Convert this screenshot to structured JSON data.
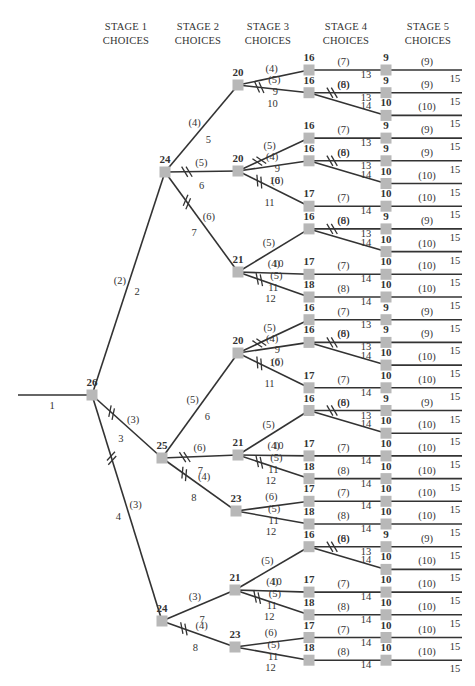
{
  "headers": [
    {
      "line1": "STAGE 1",
      "line2": "CHOICES",
      "x": 126
    },
    {
      "line1": "STAGE 2",
      "line2": "CHOICES",
      "x": 198
    },
    {
      "line1": "STAGE 3",
      "line2": "CHOICES",
      "x": 268
    },
    {
      "line1": "STAGE 4",
      "line2": "CHOICES",
      "x": 346
    },
    {
      "line1": "STAGE 5",
      "line2": "CHOICES",
      "x": 428
    }
  ],
  "colors": {
    "line": "#333333",
    "node": "#b8b8b8",
    "text": "#333333"
  },
  "root": {
    "value": "26",
    "x": 92,
    "y": 395,
    "incoming_label": "1",
    "incoming_start_x": 18
  },
  "leaf_layout": {
    "first_y": 70,
    "spacing": 22.7,
    "stage4_x": 386,
    "end_x": 462
  },
  "stage1": [
    {
      "value": "24",
      "x": 165,
      "y": 172,
      "cost": "(2)",
      "label": "2",
      "blocked": false,
      "stage2": [
        {
          "value": "20",
          "x": 238,
          "y": 85,
          "cost": "(4)",
          "label": "5",
          "blocked": false,
          "stage3": [
            {
              "value": "16",
              "cost": "(4)",
              "label": "9",
              "blocked": false,
              "leaves": [
                {
                  "row": 0,
                  "value": "9",
                  "cost": "(7)",
                  "label": "13",
                  "blocked": false
                }
              ]
            },
            {
              "value": "16",
              "cost": "(5)",
              "label": "10",
              "blocked": true,
              "leaves": [
                {
                  "row": 1,
                  "value": "9",
                  "cost": "(8)",
                  "label": "13",
                  "blocked": true
                },
                {
                  "row": 2,
                  "value": "10",
                  "cost": "(6)",
                  "label": "14",
                  "blocked": false
                }
              ]
            }
          ]
        },
        {
          "value": "20",
          "x": 238,
          "y": 171,
          "cost": "(5)",
          "label": "6",
          "blocked": true,
          "stage3": [
            {
              "value": "16",
              "cost": "(5)",
              "label": "9",
              "blocked": true,
              "leaves": [
                {
                  "row": 3,
                  "value": "9",
                  "cost": "(7)",
                  "label": "13",
                  "blocked": false
                }
              ]
            },
            {
              "value": "16",
              "cost": "(4)",
              "label": "10",
              "blocked": false,
              "leaves": [
                {
                  "row": 4,
                  "value": "9",
                  "cost": "(8)",
                  "label": "13",
                  "blocked": true
                },
                {
                  "row": 5,
                  "value": "10",
                  "cost": "(6)",
                  "label": "14",
                  "blocked": false
                }
              ]
            },
            {
              "value": "17",
              "cost": "(6)",
              "label": "11",
              "blocked": true,
              "leaves": [
                {
                  "row": 6,
                  "value": "10",
                  "cost": "(7)",
                  "label": "14",
                  "blocked": false
                }
              ]
            }
          ]
        },
        {
          "value": "21",
          "x": 238,
          "y": 272,
          "cost": "(6)",
          "label": "7",
          "blocked": true,
          "stage3": [
            {
              "value": "16",
              "cost": "(5)",
              "label": "10",
              "blocked": false,
              "leaves": [
                {
                  "row": 7,
                  "value": "9",
                  "cost": "(8)",
                  "label": "13",
                  "blocked": true
                },
                {
                  "row": 8,
                  "value": "10",
                  "cost": "(6)",
                  "label": "14",
                  "blocked": false
                }
              ]
            },
            {
              "value": "17",
              "cost": "(4)",
              "label": "11",
              "blocked": false,
              "leaves": [
                {
                  "row": 9,
                  "value": "10",
                  "cost": "(7)",
                  "label": "14",
                  "blocked": false
                }
              ]
            },
            {
              "value": "18",
              "cost": "(5)",
              "label": "12",
              "blocked": true,
              "leaves": [
                {
                  "row": 10,
                  "value": "10",
                  "cost": "(8)",
                  "label": "14",
                  "blocked": false
                }
              ]
            }
          ]
        }
      ]
    },
    {
      "value": "25",
      "x": 162,
      "y": 458,
      "cost": "(3)",
      "label": "3",
      "blocked": true,
      "stage2": [
        {
          "value": "20",
          "x": 238,
          "y": 353,
          "cost": "(5)",
          "label": "6",
          "blocked": false,
          "stage3": [
            {
              "value": "16",
              "cost": "(5)",
              "label": "9",
              "blocked": true,
              "leaves": [
                {
                  "row": 11,
                  "value": "9",
                  "cost": "(7)",
                  "label": "13",
                  "blocked": false
                }
              ]
            },
            {
              "value": "16",
              "cost": "(4)",
              "label": "10",
              "blocked": false,
              "leaves": [
                {
                  "row": 12,
                  "value": "9",
                  "cost": "(8)",
                  "label": "13",
                  "blocked": true
                },
                {
                  "row": 13,
                  "value": "10",
                  "cost": "(6)",
                  "label": "14",
                  "blocked": false
                }
              ]
            },
            {
              "value": "17",
              "cost": "(6)",
              "label": "11",
              "blocked": true,
              "leaves": [
                {
                  "row": 14,
                  "value": "10",
                  "cost": "(7)",
                  "label": "14",
                  "blocked": false
                }
              ]
            }
          ]
        },
        {
          "value": "21",
          "x": 238,
          "y": 455,
          "cost": "(6)",
          "label": "7",
          "blocked": true,
          "stage3": [
            {
              "value": "16",
              "cost": "(5)",
              "label": "10",
              "blocked": false,
              "leaves": [
                {
                  "row": 15,
                  "value": "9",
                  "cost": "(8)",
                  "label": "13",
                  "blocked": true
                },
                {
                  "row": 16,
                  "value": "10",
                  "cost": "(6)",
                  "label": "14",
                  "blocked": false
                }
              ]
            },
            {
              "value": "17",
              "cost": "(4)",
              "label": "11",
              "blocked": false,
              "leaves": [
                {
                  "row": 17,
                  "value": "10",
                  "cost": "(7)",
                  "label": "14",
                  "blocked": false
                }
              ]
            },
            {
              "value": "18",
              "cost": "(5)",
              "label": "12",
              "blocked": true,
              "leaves": [
                {
                  "row": 18,
                  "value": "10",
                  "cost": "(8)",
                  "label": "14",
                  "blocked": false
                }
              ]
            }
          ]
        },
        {
          "value": "23",
          "x": 236,
          "y": 511,
          "cost": "(4)",
          "label": "8",
          "blocked": true,
          "stage3": [
            {
              "value": "17",
              "cost": "(6)",
              "label": "11",
              "blocked": false,
              "leaves": [
                {
                  "row": 19,
                  "value": "10",
                  "cost": "(7)",
                  "label": "14",
                  "blocked": false
                }
              ]
            },
            {
              "value": "18",
              "cost": "(5)",
              "label": "12",
              "blocked": false,
              "leaves": [
                {
                  "row": 20,
                  "value": "10",
                  "cost": "(8)",
                  "label": "14",
                  "blocked": false
                }
              ]
            }
          ]
        }
      ]
    },
    {
      "value": "24",
      "x": 162,
      "y": 621,
      "cost": "(3)",
      "label": "4",
      "blocked": true,
      "stage2": [
        {
          "value": "21",
          "x": 235,
          "y": 590,
          "cost": "(3)",
          "label": "7",
          "blocked": false,
          "stage3": [
            {
              "value": "16",
              "cost": "(5)",
              "label": "10",
              "blocked": false,
              "leaves": [
                {
                  "row": 21,
                  "value": "9",
                  "cost": "(8)",
                  "label": "13",
                  "blocked": true
                },
                {
                  "row": 22,
                  "value": "10",
                  "cost": "(6)",
                  "label": "14",
                  "blocked": false
                }
              ]
            },
            {
              "value": "17",
              "cost": "(4)",
              "label": "11",
              "blocked": false,
              "leaves": [
                {
                  "row": 23,
                  "value": "10",
                  "cost": "(7)",
                  "label": "14",
                  "blocked": false
                }
              ]
            },
            {
              "value": "18",
              "cost": "(5)",
              "label": "12",
              "blocked": true,
              "leaves": [
                {
                  "row": 24,
                  "value": "10",
                  "cost": "(8)",
                  "label": "14",
                  "blocked": false
                }
              ]
            }
          ]
        },
        {
          "value": "23",
          "x": 235,
          "y": 647,
          "cost": "(4)",
          "label": "8",
          "blocked": true,
          "stage3": [
            {
              "value": "17",
              "cost": "(6)",
              "label": "11",
              "blocked": false,
              "leaves": [
                {
                  "row": 25,
                  "value": "10",
                  "cost": "(7)",
                  "label": "14",
                  "blocked": false
                }
              ]
            },
            {
              "value": "18",
              "cost": "(5)",
              "label": "12",
              "blocked": false,
              "leaves": [
                {
                  "row": 26,
                  "value": "10",
                  "cost": "(8)",
                  "label": "14",
                  "blocked": false
                }
              ]
            }
          ]
        }
      ]
    }
  ],
  "stage3_x": 309,
  "leaf_edge": {
    "row9": {
      "cost": "(9)",
      "label": "15"
    },
    "row10": {
      "cost": "(10)",
      "label": "15"
    }
  }
}
